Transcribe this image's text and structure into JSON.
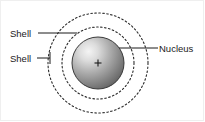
{
  "figure": {
    "type": "labeled-diagram",
    "width": 205,
    "height": 122,
    "background_color": "#ffffff",
    "border_color": "#efefef"
  },
  "labels": {
    "shell_outer": "Shell",
    "shell_inner": "Shell",
    "nucleus": "Nucleus"
  },
  "diagram": {
    "center": {
      "x": 98,
      "y": 63
    },
    "nucleus": {
      "name": "nucleus-sphere",
      "radius": 26,
      "fill_light": "#f2f2f2",
      "fill_mid": "#a8a8a8",
      "fill_dark": "#4a4a4a",
      "outline_color": "#3a3a3a",
      "center_mark": "+"
    },
    "shells": [
      {
        "name": "inner-shell",
        "radius": 36,
        "style": "dashed",
        "color": "#2b2b2b"
      },
      {
        "name": "outer-shell",
        "radius": 50,
        "style": "dashed",
        "color": "#2b2b2b"
      }
    ],
    "leader_lines": [
      {
        "name": "shell-outer-leader",
        "from": {
          "x": 38,
          "y": 33
        },
        "to": {
          "x": 77,
          "y": 33
        },
        "color": "#1a1a1a"
      },
      {
        "name": "shell-inner-leader",
        "from": {
          "x": 37,
          "y": 58
        },
        "to": {
          "x": 50,
          "y": 58
        },
        "color": "#1a1a1a"
      },
      {
        "name": "nucleus-leader",
        "from": {
          "x": 120,
          "y": 48
        },
        "to": {
          "x": 158,
          "y": 48
        },
        "color": "#1a1a1a"
      }
    ]
  }
}
